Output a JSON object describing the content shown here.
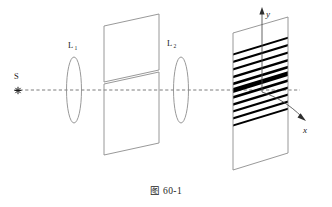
{
  "figure": {
    "caption": "图 60-1",
    "caption_number": "60-1",
    "caption_prefix": "图"
  },
  "labels": {
    "source": "S",
    "lens1": "L",
    "lens1_sub": "1",
    "lens2": "L",
    "lens2_sub": "2",
    "axis_x": "x",
    "axis_y": "y"
  },
  "icons": {
    "source_marker": "asterisk-icon",
    "x_arrow": "arrow-right-icon",
    "y_arrow": "arrow-up-icon"
  },
  "colors": {
    "outline": "#8d8d8d",
    "fringe_dark": "#000000",
    "axis_dashed": "#5a5a5a",
    "axis_solid": "#4a4a4a",
    "background": "#ffffff",
    "text": "#1a1a1a"
  },
  "elements": {
    "source_point": {
      "x": 18,
      "y": 90
    },
    "optical_axis": {
      "x1": 14,
      "y1": 90,
      "x2": 332,
      "y2": 90
    },
    "lens1": {
      "cx": 74,
      "cy": 90,
      "rx": 7.5,
      "ry": 33
    },
    "lens2": {
      "cx": 180,
      "cy": 90,
      "rx": 7.5,
      "ry": 33
    },
    "aperture_upper": {
      "points": "103,23 158,23 158,78 103,78",
      "skew": 22
    },
    "aperture_lower": {
      "points": "103,90 158,90 158,152 103,152",
      "skew": 22
    },
    "screen": {
      "points": "233,33 288,17 288,153 233,170",
      "skew": 17
    }
  },
  "chart_data": {
    "type": "line",
    "xlabel": "x",
    "ylabel": "y",
    "fringe_count": 11,
    "central_fringe_index": 5,
    "fringe_orientation_deg": -17,
    "fringe_widths": [
      1.9,
      2.1,
      2.2,
      2.4,
      2.6,
      4.6,
      2.6,
      2.4,
      2.2,
      2.1,
      1.9
    ],
    "fringe_offsets_y": [
      -36,
      -28.5,
      -21,
      -13.5,
      -6.5,
      0,
      7,
      14,
      21,
      28,
      35
    ],
    "note": "Equally spaced straight dark fringes, thickest/darkest at the optical axis"
  }
}
